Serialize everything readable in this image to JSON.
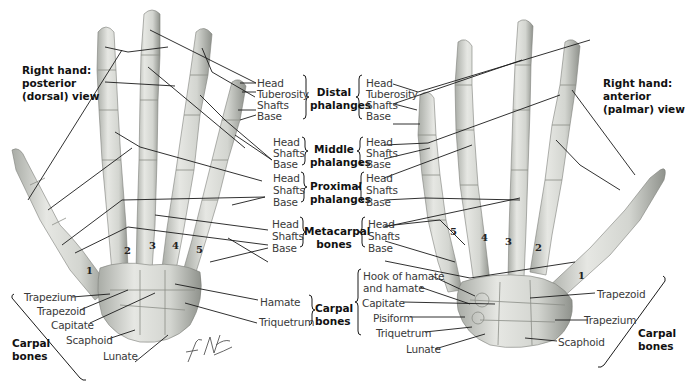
{
  "figure": {
    "left_view_title": [
      "Right hand:",
      "posterior",
      "(dorsal) view"
    ],
    "right_view_title": [
      "Right hand:",
      "anterior",
      "(palmar) view"
    ],
    "signature": "F. Netter M.D.",
    "colors": {
      "bone": "#d9dbd6",
      "bone_shadow": "#9ea19b",
      "line": "#1a1a1a",
      "text": "#3a3a3a"
    }
  },
  "center_legend": {
    "groups": [
      {
        "name": [
          "Distal",
          "phalanges"
        ],
        "parts": [
          "Head",
          "Tuberosity",
          "Shafts",
          "Base"
        ]
      },
      {
        "name": [
          "Middle",
          "phalanges"
        ],
        "parts": [
          "Head",
          "Shafts",
          "Base"
        ]
      },
      {
        "name": [
          "Proximal",
          "phalanges"
        ],
        "parts": [
          "Head",
          "Shafts",
          "Base"
        ]
      },
      {
        "name": [
          "Metacarpal",
          "bones"
        ],
        "parts": [
          "Head",
          "Shafts",
          "Base"
        ]
      }
    ]
  },
  "left_hand": {
    "metacarpal_numbers": [
      "1",
      "2",
      "3",
      "4",
      "5"
    ],
    "carpal_labels_left": [
      "Trapezium",
      "Trapezoid",
      "Capitate",
      "Scaphoid",
      "Lunate"
    ],
    "carpal_labels_right": [
      "Hamate",
      "Triquetrum"
    ],
    "carpal_group_left": [
      "Carpal",
      "bones"
    ],
    "carpal_group_right": [
      "Carpal",
      "bones"
    ]
  },
  "right_hand": {
    "metacarpal_numbers": [
      "5",
      "4",
      "3",
      "2",
      "1"
    ],
    "carpal_labels_left": [
      "Hook of hamate",
      "and hamate",
      "Capitate",
      "Pisiform",
      "Triquetrum",
      "Lunate"
    ],
    "carpal_labels_right": [
      "Trapezoid",
      "Trapezium",
      "Scaphoid"
    ],
    "carpal_group": [
      "Carpal",
      "bones"
    ]
  }
}
